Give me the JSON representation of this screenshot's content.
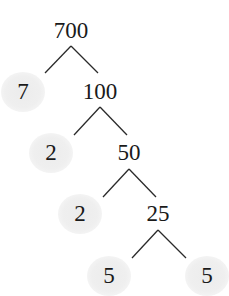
{
  "diagram": {
    "type": "factor-tree",
    "root": "700",
    "nodes": [
      {
        "id": "n700",
        "label": "700",
        "x": 71,
        "y": 30,
        "prime": false
      },
      {
        "id": "n7",
        "label": "7",
        "x": 23,
        "y": 91,
        "prime": true
      },
      {
        "id": "n100",
        "label": "100",
        "x": 100,
        "y": 91,
        "prime": false
      },
      {
        "id": "n2a",
        "label": "2",
        "x": 51,
        "y": 152,
        "prime": true
      },
      {
        "id": "n50",
        "label": "50",
        "x": 129,
        "y": 152,
        "prime": false
      },
      {
        "id": "n2b",
        "label": "2",
        "x": 80,
        "y": 213,
        "prime": true
      },
      {
        "id": "n25",
        "label": "25",
        "x": 158,
        "y": 213,
        "prime": false
      },
      {
        "id": "n5a",
        "label": "5",
        "x": 109,
        "y": 275,
        "prime": true
      },
      {
        "id": "n5b",
        "label": "5",
        "x": 207,
        "y": 275,
        "prime": true
      }
    ],
    "edges": [
      {
        "from": "n700",
        "to": "n7",
        "x1": 71,
        "y1": 46,
        "x2": 45,
        "y2": 73
      },
      {
        "from": "n700",
        "to": "n100",
        "x1": 71,
        "y1": 46,
        "x2": 98,
        "y2": 73
      },
      {
        "from": "n100",
        "to": "n2a",
        "x1": 100,
        "y1": 107,
        "x2": 74,
        "y2": 135
      },
      {
        "from": "n100",
        "to": "n50",
        "x1": 100,
        "y1": 107,
        "x2": 127,
        "y2": 135
      },
      {
        "from": "n50",
        "to": "n2b",
        "x1": 129,
        "y1": 169,
        "x2": 103,
        "y2": 197
      },
      {
        "from": "n50",
        "to": "n25",
        "x1": 129,
        "y1": 169,
        "x2": 156,
        "y2": 197
      },
      {
        "from": "n25",
        "to": "n5a",
        "x1": 158,
        "y1": 230,
        "x2": 132,
        "y2": 258
      },
      {
        "from": "n25",
        "to": "n5b",
        "x1": 158,
        "y1": 230,
        "x2": 186,
        "y2": 258
      }
    ],
    "prime_factors": [
      "7",
      "2",
      "2",
      "5",
      "5"
    ],
    "colors": {
      "text": "#1a1a1a",
      "line": "#2a2a2a",
      "prime_highlight": "#ececec"
    }
  }
}
